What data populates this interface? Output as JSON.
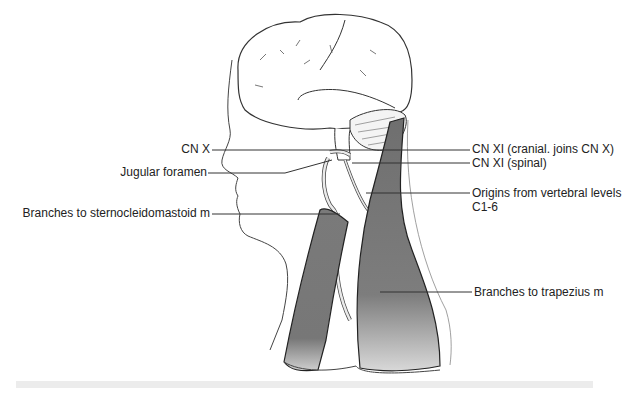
{
  "figure": {
    "labels_left": [
      {
        "id": "cn-x",
        "text": "CN X"
      },
      {
        "id": "jugular-foramen",
        "text": "Jugular foramen"
      },
      {
        "id": "branches-scm",
        "text": "Branches to sternocleidomastoid m"
      }
    ],
    "labels_right": [
      {
        "id": "cn-xi-cranial",
        "text": "CN XI (cranial. joins CN X)"
      },
      {
        "id": "cn-xi-spinal",
        "text": "CN XI (spinal)"
      },
      {
        "id": "origins-line1",
        "text": "Origins from vertebral levels"
      },
      {
        "id": "origins-line2",
        "text": "C1-6"
      },
      {
        "id": "branches-trapezius",
        "text": "Branches to trapezius m"
      }
    ],
    "colors": {
      "outline": "#333333",
      "muscle": "#7a7a7a",
      "muscle_light": "#c8c8c8",
      "nerve": "#e6e6e6",
      "caption_band": "#ececec"
    }
  }
}
